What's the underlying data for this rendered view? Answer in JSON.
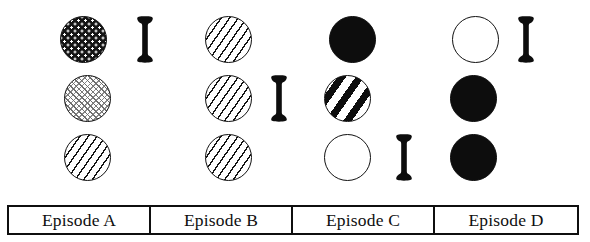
{
  "figure": {
    "columns": [
      {
        "id": "A",
        "label": "Episode A"
      },
      {
        "id": "B",
        "label": "Episode B"
      },
      {
        "id": "C",
        "label": "Episode C"
      },
      {
        "id": "D",
        "label": "Episode D"
      }
    ],
    "rows": [
      {
        "row": 1,
        "cells": [
          {
            "column": "A",
            "circle_fill": "dense-dot-grid",
            "circle_name": "circle-dotgrid",
            "dumbbell": true
          },
          {
            "column": "B",
            "circle_fill": "thin-diagonal-hatch",
            "circle_name": "circle-hatch-thin",
            "dumbbell": false
          },
          {
            "column": "C",
            "circle_fill": "solid-black",
            "circle_name": "circle-solid",
            "dumbbell": false
          },
          {
            "column": "D",
            "circle_fill": "open-white",
            "circle_name": "circle-open",
            "dumbbell": true
          }
        ]
      },
      {
        "row": 2,
        "cells": [
          {
            "column": "A",
            "circle_fill": "light-stipple",
            "circle_name": "circle-stipple",
            "dumbbell": false
          },
          {
            "column": "B",
            "circle_fill": "thin-diagonal-hatch",
            "circle_name": "circle-hatch-thin",
            "dumbbell": true
          },
          {
            "column": "C",
            "circle_fill": "bold-diagonal-stripe",
            "circle_name": "circle-stripe-bold",
            "dumbbell": false
          },
          {
            "column": "D",
            "circle_fill": "solid-black",
            "circle_name": "circle-solid",
            "dumbbell": false
          }
        ]
      },
      {
        "row": 3,
        "cells": [
          {
            "column": "A",
            "circle_fill": "thin-diagonal-hatch",
            "circle_name": "circle-hatch-thin",
            "dumbbell": false
          },
          {
            "column": "B",
            "circle_fill": "thin-diagonal-hatch",
            "circle_name": "circle-hatch-thin",
            "dumbbell": false
          },
          {
            "column": "C",
            "circle_fill": "open-white",
            "circle_name": "circle-open",
            "dumbbell": true
          },
          {
            "column": "D",
            "circle_fill": "solid-black",
            "circle_name": "circle-solid",
            "dumbbell": false
          }
        ]
      }
    ],
    "colors": {
      "ink": "#0f0f0f",
      "paper": "#ffffff",
      "stipple_gray": "#7a7a7a"
    }
  }
}
